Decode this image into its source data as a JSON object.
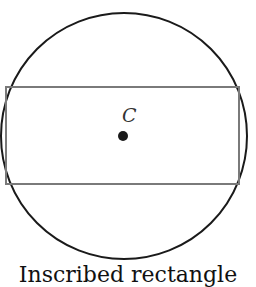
{
  "figure": {
    "center_label": "C",
    "caption": "Inscribed rectangle",
    "circle": {
      "cx": 124,
      "cy": 136,
      "r": 124
    },
    "rectangle": {
      "x": 6,
      "y": 87,
      "width": 233,
      "height": 97
    },
    "colors": {
      "circle": "#1a1a1a",
      "rectangle": "#7a7a7a",
      "point": "#1a1a1a"
    }
  }
}
